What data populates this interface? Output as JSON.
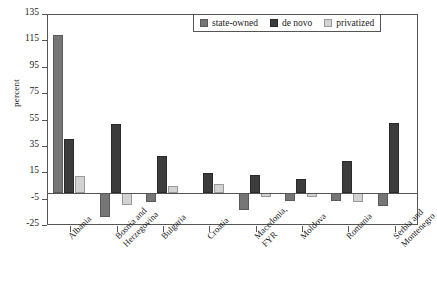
{
  "chart_data": {
    "type": "bar",
    "title": "",
    "subtitle": "",
    "xlabel": "",
    "ylabel": "percent",
    "ylim": [
      -25,
      135
    ],
    "yticks": [
      135,
      115,
      95,
      75,
      55,
      35,
      15,
      -5,
      -25
    ],
    "ytick_labels": [
      "135",
      "115",
      "95",
      "75",
      "55",
      "35",
      "15",
      "-5",
      "-25"
    ],
    "grid": false,
    "legend_position": "top-right",
    "categories": [
      "Albania",
      "Bosnia and Herzegovina",
      "Bulgaria",
      "Croatia",
      "Macedonia, FYR",
      "Moldova",
      "Romania",
      "Serbia and Montenegro"
    ],
    "category_lines": [
      [
        "Albania",
        ""
      ],
      [
        "Bosnia and",
        "Herzegovina"
      ],
      [
        "Bulgaria",
        ""
      ],
      [
        "Croatia",
        ""
      ],
      [
        "Macedonia,",
        "FYR"
      ],
      [
        "Moldova",
        ""
      ],
      [
        "Romania",
        ""
      ],
      [
        "Serbia and",
        "Montenegro"
      ]
    ],
    "series": [
      {
        "name": "state-owned",
        "color": "#767676",
        "values": [
          120,
          -18,
          -7,
          0,
          -13,
          -6,
          -6,
          -10
        ]
      },
      {
        "name": "de novo",
        "color": "#3c3c3c",
        "values": [
          41,
          52,
          28,
          15,
          14,
          11,
          24,
          53
        ]
      },
      {
        "name": "privatized",
        "color": "#d2d2d2",
        "values": [
          13,
          -9,
          5,
          7,
          -3,
          -3,
          -7,
          0
        ]
      }
    ]
  },
  "legend": {
    "items": [
      {
        "label": "state-owned",
        "swatch": "state-owned-swatch"
      },
      {
        "label": "de novo",
        "swatch": "de-novo-swatch"
      },
      {
        "label": "privatized",
        "swatch": "privatized-swatch"
      }
    ]
  },
  "axes": {
    "y_title": "percent"
  },
  "footnote": {
    "text": ""
  }
}
